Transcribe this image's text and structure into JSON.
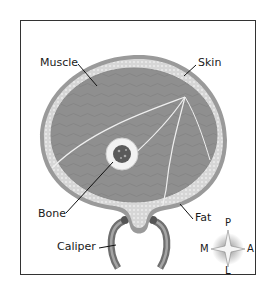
{
  "diagram": {
    "labels": {
      "muscle": "Muscle",
      "skin": "Skin",
      "bone": "Bone",
      "fat": "Fat",
      "caliper": "Caliper"
    },
    "compass": {
      "top": "P",
      "left": "M",
      "right": "A",
      "bottom": "L"
    },
    "colors": {
      "muscle": "#8c8c8c",
      "fat_layer": "#d9d9d9",
      "skin": "#9a9a9a",
      "bone_ring": "#f2f2f2",
      "marrow": "#555555",
      "frame": "#333333",
      "leader_line": "#111111"
    }
  }
}
